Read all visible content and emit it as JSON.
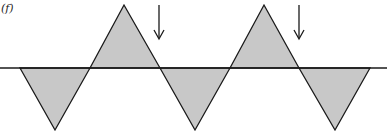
{
  "panel_label": "(f)",
  "colors": {
    "fill": "#c8c8c8",
    "stroke": "#1a1a1a",
    "background": "#ffffff"
  },
  "baseline_y": 68,
  "wave_points": [
    [
      20,
      68
    ],
    [
      55,
      130
    ],
    [
      90,
      68
    ],
    [
      124,
      5
    ],
    [
      160,
      68
    ],
    [
      195,
      130
    ],
    [
      230,
      68
    ],
    [
      264,
      5
    ],
    [
      299,
      68
    ],
    [
      335,
      130
    ],
    [
      370,
      68
    ]
  ],
  "arrows": [
    {
      "x": 159,
      "y1": 5,
      "y2": 40
    },
    {
      "x": 299,
      "y1": 5,
      "y2": 40
    }
  ]
}
